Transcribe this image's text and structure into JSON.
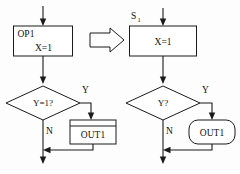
{
  "diagram": {
    "transform_symbol": "⇒",
    "left": {
      "name": "original-flowchart",
      "process": {
        "tag": "OP1",
        "body": "X=1"
      },
      "decision": {
        "text": "Y=1?"
      },
      "branch_yes": "Y",
      "branch_no": "N",
      "output": {
        "text": "OUT1",
        "shape": "rectangle"
      }
    },
    "right": {
      "name": "transformed-flowchart",
      "state_label": "S",
      "state_subscript": "1",
      "process": {
        "body": "X=1"
      },
      "decision": {
        "text": "Y?"
      },
      "branch_yes": "Y",
      "branch_no": "N",
      "output": {
        "text": "OUT1",
        "shape": "rounded-rectangle"
      }
    },
    "colors": {
      "stroke": "#1a1a1a",
      "fill": "#ffffff",
      "background": "#fdfdfd",
      "text": "#111111"
    }
  }
}
